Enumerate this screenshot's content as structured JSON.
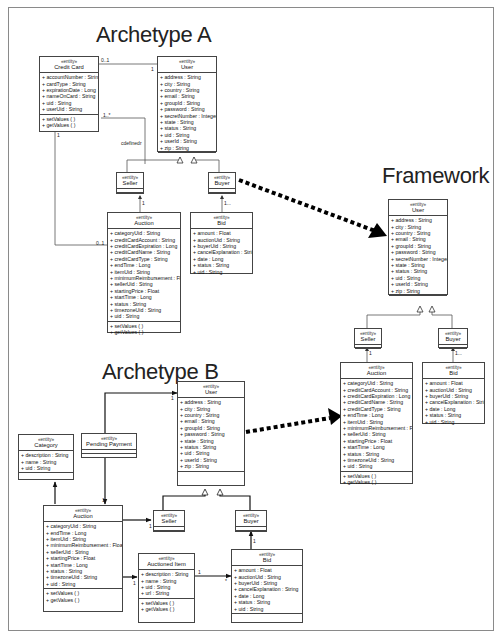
{
  "titles": {
    "archetype_a": "Archetype A",
    "framework": "Framework",
    "archetype_b": "Archetype B"
  },
  "stereotype": "«entity»",
  "archetype_a": {
    "credit_card": {
      "name": "Credit Card",
      "attributes": [
        "+ accountNumber : String",
        "+ cardType : String",
        "+ expirationDate : Long",
        "+ nameOnCard : String",
        "+ uid : String",
        "+ userUid : String"
      ],
      "operations": [
        "+ setValues ( )",
        "+ getValues ( )"
      ]
    },
    "user": {
      "name": "User",
      "attributes": [
        "+ address : String",
        "+ city : String",
        "+ country : String",
        "+ email : String",
        "+ groupId : String",
        "+ password : String",
        "+ secretNumber : Integer",
        "+ state : String",
        "+ status : String",
        "+ uid : String",
        "+ userId : String",
        "+ zip : String"
      ]
    },
    "seller": {
      "name": "Seller"
    },
    "buyer": {
      "name": "Buyer"
    },
    "auction": {
      "name": "Auction",
      "attributes": [
        "+ categoryUid : String",
        "+ creditCardAccount : String",
        "+ creditCardExpiration : Long",
        "+ creditCardName : String",
        "+ creditCardType : String",
        "+ endTime : Long",
        "+ itemUid : String",
        "+ minimumReimbursement : Float",
        "+ sellerUid : String",
        "+ startingPrice : Float",
        "+ startTime : Long",
        "+ status : String",
        "+ timezoneUid : String",
        "+ uid : String"
      ],
      "operations": [
        "+ setValues ( )",
        "+ getValues ( )"
      ]
    },
    "bid": {
      "name": "Bid",
      "attributes": [
        "+ amount : Float",
        "+ auctionUid : String",
        "+ buyerUid : String",
        "+ cancelExplanation : String",
        "+ date : Long",
        "+ status : String",
        "+ uid : String"
      ]
    },
    "labels": {
      "cc_user_mult_cc": "0..1",
      "cc_user_mult_user": "1",
      "cc_seller_mult": "1..*",
      "cc_seller_role": "cdefinedr",
      "cc_auction_mult_cc": "1",
      "cc_auction_mult_auction": "0..1",
      "auction_seller_mult": "1",
      "bid_buyer_mult": "1..."
    }
  },
  "framework": {
    "user": {
      "name": "User",
      "attributes": [
        "+ address : String",
        "+ city : String",
        "+ country : String",
        "+ email : String",
        "+ groupId : String",
        "+ password : String",
        "+ secretNumber : Integer",
        "+ state : String",
        "+ status : String",
        "+ uid : String",
        "+ userId : String",
        "+ zip : String"
      ]
    },
    "seller": {
      "name": "Seller"
    },
    "buyer": {
      "name": "Buyer"
    },
    "auction": {
      "name": "Auction",
      "attributes": [
        "+ categoryUid : String",
        "+ creditCardAccount : String",
        "+ creditCardExpiration : Long",
        "+ creditCardName : String",
        "+ creditCardType : String",
        "+ endTime : Long",
        "+ itemUid : String",
        "+ minimumReimbursement : Float",
        "+ sellerUid : String",
        "+ startingPrice : Float",
        "+ startTime : Long",
        "+ status : String",
        "+ timezoneUid : String",
        "+ uid : String"
      ],
      "operations": [
        "+ setValues ( )",
        "+ getValues ( )"
      ]
    },
    "bid": {
      "name": "Bid",
      "attributes": [
        "+ amount : Float",
        "+ auctionUid : String",
        "+ buyerUid : String",
        "+ cancelExplanation : String",
        "+ date : Long",
        "+ status : String",
        "+ uid : String"
      ]
    },
    "labels": {
      "auction_seller_mult": "1",
      "bid_buyer_mult": "1..."
    }
  },
  "archetype_b": {
    "category": {
      "name": "Category",
      "attributes": [
        "+ description : String",
        "+ name : String",
        "+ uid : String"
      ]
    },
    "pending_payment": {
      "name": "Pending Payment"
    },
    "user": {
      "name": "User",
      "attributes": [
        "+ address : String",
        "+ city : String",
        "+ country : String",
        "+ email : String",
        "+ groupId : String",
        "+ password : String",
        "+ state : String",
        "+ status : String",
        "+ uid : String",
        "+ userId : String",
        "+ zip : String"
      ]
    },
    "seller": {
      "name": "Seller"
    },
    "buyer": {
      "name": "Buyer"
    },
    "auction": {
      "name": "Auction",
      "attributes": [
        "+ categoryUid : String",
        "+ endTime : Long",
        "+ itemUid : String",
        "+ minimumReimbursement : Float",
        "+ sellerUid : String",
        "+ startingPrice : Float",
        "+ startTime : Long",
        "+ status : String",
        "+ timezoneUid : String",
        "+ uid : String"
      ],
      "operations": [
        "+ setValues ( )",
        "+ getValues ( )"
      ]
    },
    "auctioned_item": {
      "name": "Auctioned Item",
      "attributes": [
        "+ description : String",
        "+ name : String",
        "+ uid : String",
        "+ url : String"
      ],
      "operations": [
        "+ setValues ( )",
        "+ getValues ( )"
      ]
    },
    "bid": {
      "name": "Bid",
      "attributes": [
        "+ amount : Float",
        "+ auctionUid : String",
        "+ buyerUid : String",
        "+ cancelExplanation : String",
        "+ date : Long",
        "+ status : String",
        "+ uid : String"
      ]
    },
    "labels": {
      "pp_user_mult": "1",
      "pp_auction_mult": "1",
      "auction_seller_mult": "1",
      "auction_item_mult": "1",
      "item_bid_mult_item": "1",
      "item_bid_mult_bid": "*",
      "bid_buyer_mult": "1"
    }
  }
}
